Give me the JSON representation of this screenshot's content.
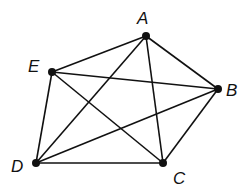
{
  "diagram": {
    "type": "complete-graph",
    "name": "K5",
    "vertices": [
      {
        "id": "A",
        "label": "A",
        "x": 146,
        "y": 36,
        "label_x": 137,
        "label_y": 24
      },
      {
        "id": "B",
        "label": "B",
        "x": 218,
        "y": 89,
        "label_x": 226,
        "label_y": 96
      },
      {
        "id": "C",
        "label": "C",
        "x": 163,
        "y": 163,
        "label_x": 173,
        "label_y": 184
      },
      {
        "id": "D",
        "label": "D",
        "x": 36,
        "y": 163,
        "label_x": 11,
        "label_y": 172
      },
      {
        "id": "E",
        "label": "E",
        "x": 52,
        "y": 72,
        "label_x": 28,
        "label_y": 72
      }
    ],
    "edges": [
      [
        "A",
        "E"
      ],
      [
        "A",
        "B"
      ],
      [
        "A",
        "C"
      ],
      [
        "A",
        "D"
      ],
      [
        "E",
        "B"
      ],
      [
        "E",
        "C"
      ],
      [
        "E",
        "D"
      ],
      [
        "B",
        "C"
      ],
      [
        "B",
        "D"
      ],
      [
        "D",
        "C"
      ]
    ],
    "colors": {
      "stroke": "#111111",
      "background": "#ffffff"
    }
  }
}
